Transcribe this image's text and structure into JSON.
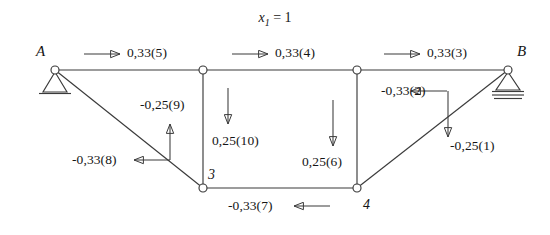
{
  "figure": {
    "title_var": "x",
    "title_sub": "1",
    "title_eq": "= 1",
    "background_color": "#ffffff",
    "line_color": "#3a3a3a",
    "text_color": "#151515"
  },
  "nodes": [
    {
      "id": "A",
      "label": "A",
      "x": 55,
      "y": 70,
      "support": "pin"
    },
    {
      "id": "B",
      "label": "B",
      "x": 508,
      "y": 70,
      "support": "roller"
    },
    {
      "id": "t1",
      "label": "",
      "x": 203,
      "y": 70,
      "support": "none"
    },
    {
      "id": "t2",
      "label": "",
      "x": 357,
      "y": 70,
      "support": "none"
    },
    {
      "id": "3",
      "label": "3",
      "x": 203,
      "y": 188,
      "support": "none"
    },
    {
      "id": "4",
      "label": "4",
      "x": 357,
      "y": 188,
      "support": "none"
    }
  ],
  "members": [
    {
      "from": "A",
      "to": "t1"
    },
    {
      "from": "t1",
      "to": "t2"
    },
    {
      "from": "t2",
      "to": "B"
    },
    {
      "from": "A",
      "to": "3"
    },
    {
      "from": "t1",
      "to": "3"
    },
    {
      "from": "t2",
      "to": "4"
    },
    {
      "from": "3",
      "to": "4"
    },
    {
      "from": "4",
      "to": "B"
    }
  ],
  "forces": [
    {
      "id": "5",
      "label": "0,33(5)",
      "direction": "right",
      "value": 0.33,
      "member": "top-left-chord"
    },
    {
      "id": "4",
      "label": "0,33(4)",
      "direction": "right",
      "value": 0.33,
      "member": "top-middle-chord"
    },
    {
      "id": "3",
      "label": "0,33(3)",
      "direction": "right",
      "value": 0.33,
      "member": "top-right-chord"
    },
    {
      "id": "2",
      "label": "-0,33(2)",
      "direction": "left",
      "value": -0.33,
      "member": "right-diagonal"
    },
    {
      "id": "1",
      "label": "-0,25(1)",
      "direction": "down",
      "value": -0.25,
      "member": "right-diagonal"
    },
    {
      "id": "9",
      "label": "-0,25(9)",
      "direction": "up",
      "value": -0.25,
      "member": "left-diagonal"
    },
    {
      "id": "8",
      "label": "-0,33(8)",
      "direction": "left",
      "value": -0.33,
      "member": "left-diagonal"
    },
    {
      "id": "10",
      "label": "0,25(10)",
      "direction": "down",
      "value": 0.25,
      "member": "left-vertical"
    },
    {
      "id": "6",
      "label": "0,25(6)",
      "direction": "down",
      "value": 0.25,
      "member": "right-vertical"
    },
    {
      "id": "7",
      "label": "-0,33(7)",
      "direction": "left",
      "value": -0.33,
      "member": "bottom-chord"
    }
  ],
  "node_labels": {
    "A": "A",
    "B": "B",
    "three": "3",
    "four": "4"
  }
}
